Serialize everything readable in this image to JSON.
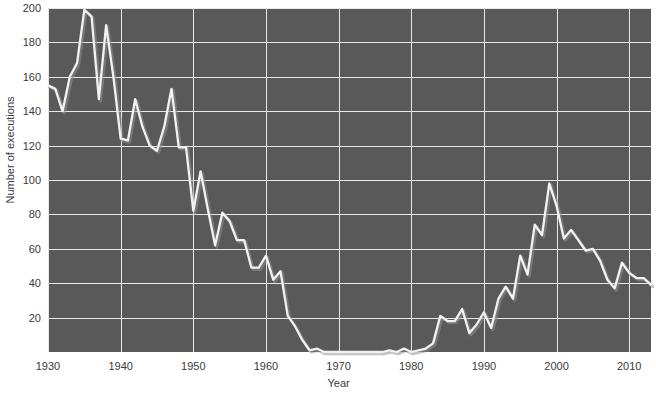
{
  "chart_data": {
    "type": "line",
    "title": "",
    "subtitle": "",
    "xlabel": "Year",
    "ylabel": "Number of executions",
    "xlim": [
      1930,
      2013
    ],
    "ylim": [
      0,
      200
    ],
    "xticks": [
      1930,
      1940,
      1950,
      1960,
      1970,
      1980,
      1990,
      2000,
      2010
    ],
    "xticklabels": [
      "1930",
      "1940",
      "1950",
      "1960",
      "1970",
      "1980",
      "1990",
      "2000",
      "2010"
    ],
    "yticks": [
      20,
      40,
      60,
      80,
      100,
      120,
      140,
      160,
      180,
      200
    ],
    "yticklabels": [
      "20",
      "40",
      "60",
      "80",
      "100",
      "120",
      "140",
      "160",
      "180",
      "200"
    ],
    "grid": true,
    "legend": false,
    "legend_position": "none",
    "line_color": "#f2f2f2",
    "plot_background": "#595959",
    "figure_background": "#ffffff",
    "grid_color": "#e8e8e8",
    "x": [
      1930,
      1931,
      1932,
      1933,
      1934,
      1935,
      1936,
      1937,
      1938,
      1939,
      1940,
      1941,
      1942,
      1943,
      1944,
      1945,
      1946,
      1947,
      1948,
      1949,
      1950,
      1951,
      1952,
      1953,
      1954,
      1955,
      1956,
      1957,
      1958,
      1959,
      1960,
      1961,
      1962,
      1963,
      1964,
      1965,
      1966,
      1967,
      1968,
      1969,
      1970,
      1971,
      1972,
      1973,
      1974,
      1975,
      1976,
      1977,
      1978,
      1979,
      1980,
      1981,
      1982,
      1983,
      1984,
      1985,
      1986,
      1987,
      1988,
      1989,
      1990,
      1991,
      1992,
      1993,
      1994,
      1995,
      1996,
      1997,
      1998,
      1999,
      2000,
      2001,
      2002,
      2003,
      2004,
      2005,
      2006,
      2007,
      2008,
      2009,
      2010,
      2011,
      2012,
      2013
    ],
    "values": [
      155,
      153,
      140,
      160,
      168,
      199,
      195,
      147,
      190,
      160,
      124,
      123,
      147,
      131,
      120,
      117,
      131,
      153,
      119,
      119,
      82,
      105,
      83,
      62,
      81,
      76,
      65,
      65,
      49,
      49,
      56,
      42,
      47,
      21,
      15,
      7,
      1,
      2,
      0,
      0,
      0,
      0,
      0,
      0,
      0,
      0,
      0,
      1,
      0,
      2,
      0,
      1,
      2,
      5,
      21,
      18,
      18,
      25,
      11,
      16,
      23,
      14,
      31,
      38,
      31,
      56,
      45,
      74,
      68,
      98,
      85,
      66,
      71,
      65,
      59,
      60,
      53,
      42,
      37,
      52,
      46,
      43,
      43,
      39
    ],
    "series": [
      {
        "name": "Number of executions",
        "values": [
          155,
          153,
          140,
          160,
          168,
          199,
          195,
          147,
          190,
          160,
          124,
          123,
          147,
          131,
          120,
          117,
          131,
          153,
          119,
          119,
          82,
          105,
          83,
          62,
          81,
          76,
          65,
          65,
          49,
          49,
          56,
          42,
          47,
          21,
          15,
          7,
          1,
          2,
          0,
          0,
          0,
          0,
          0,
          0,
          0,
          0,
          0,
          1,
          0,
          2,
          0,
          1,
          2,
          5,
          21,
          18,
          18,
          25,
          11,
          16,
          23,
          14,
          31,
          38,
          31,
          56,
          45,
          74,
          68,
          98,
          85,
          66,
          71,
          65,
          59,
          60,
          53,
          42,
          37,
          52,
          46,
          43,
          43,
          39
        ]
      }
    ]
  }
}
